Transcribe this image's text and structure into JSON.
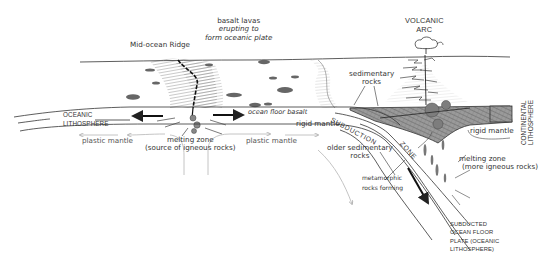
{
  "diagram": {
    "type": "plate-tectonics-cross-section",
    "labels": {
      "mid_ocean_ridge": "Mid-ocean Ridge",
      "basalt_lavas": [
        "basalt lavas",
        "erupting to",
        "form oceanic plate"
      ],
      "volcanic_arc": [
        "VOLCANIC",
        "ARC"
      ],
      "sedimentary_rocks": [
        "sedimentary",
        "rocks"
      ],
      "oceanic_lithosphere": [
        "OCEANIC",
        "LITHOSPHERE"
      ],
      "ocean_floor_basalt": "ocean floor basalt",
      "rigid_mantle_left": "rigid mantle",
      "rigid_mantle_right": "rigid mantle",
      "subduction": "SUBDUCTION",
      "zone": "ZONE",
      "continental_lithosphere": [
        "CONTINENTAL",
        "LITHOSPHERE"
      ],
      "plastic_mantle_left": "plastic mantle",
      "plastic_mantle_mid": "plastic mantle",
      "melting_zone_ridge": [
        "melting zone",
        "(source of igneous rocks)"
      ],
      "older_sedimentary": [
        "older sedimentary",
        "rocks"
      ],
      "melting_zone_arc": [
        "melting zone",
        "(more igneous rocks)"
      ],
      "metamorphic": [
        "metamorphic",
        "rocks forming"
      ],
      "subducted_plate": [
        "SUBDUCTED",
        "OCEAN FLOOR",
        "PLATE (OCEANIC",
        "LITHOSPHERE)"
      ]
    },
    "colors": {
      "ink": "#222222",
      "grey_arrow": "#b5b5b5",
      "hatch": "#6b6b6b",
      "continent_fill": "#8a8a8a",
      "ocean_band": "#ffffff"
    }
  }
}
